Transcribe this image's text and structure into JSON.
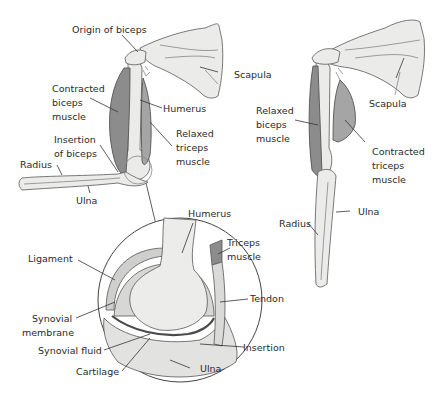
{
  "left_arm": {
    "title": "Flexed arm",
    "labels": {
      "origin_biceps": "Origin of biceps",
      "scapula": "Scapula",
      "contracted_biceps": [
        "Contracted",
        "biceps",
        "muscle"
      ],
      "humerus": "Humerus",
      "relaxed_triceps": [
        "Relaxed",
        "triceps",
        "muscle"
      ],
      "insertion_biceps": [
        "Insertion",
        "of biceps"
      ],
      "radius": "Radius",
      "ulna": "Ulna"
    }
  },
  "right_arm": {
    "title": "Extended arm",
    "labels": {
      "scapula": "Scapula",
      "relaxed_biceps": [
        "Relaxed",
        "biceps",
        "muscle"
      ],
      "contracted_triceps": [
        "Contracted",
        "triceps",
        "muscle"
      ],
      "radius": "Radius",
      "ulna": "Ulna"
    }
  },
  "joint_detail": {
    "title": "Elbow joint detail",
    "labels": {
      "humerus": "Humerus",
      "ligament": "Ligament",
      "triceps": [
        "Triceps",
        "muscle"
      ],
      "tendon": "Tendon",
      "synovial_membrane": [
        "Synovial",
        "membrane"
      ],
      "synovial_fluid": "Synovial fluid",
      "insertion": "Insertion",
      "cartilage": "Cartilage",
      "ulna": "Ulna"
    }
  }
}
